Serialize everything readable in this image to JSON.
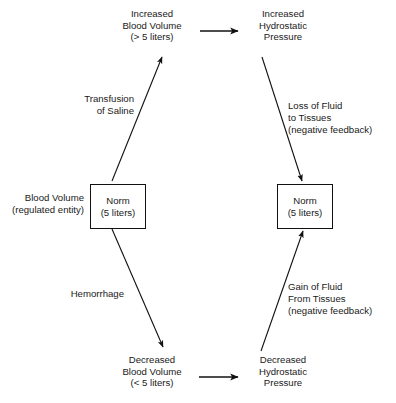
{
  "diagram": {
    "background_color": "#ffffff",
    "stroke_color": "#111111",
    "text_color": "#1a1a1a",
    "nodes": {
      "increased_volume": {
        "line1": "Increased",
        "line2": "Blood Volume",
        "line3": "(> 5 liters)"
      },
      "increased_pressure": {
        "line1": "Increased",
        "line2": "Hydrostatic",
        "line3": "Pressure"
      },
      "decreased_volume": {
        "line1": "Decreased",
        "line2": "Blood Volume",
        "line3": "(< 5 liters)"
      },
      "decreased_pressure": {
        "line1": "Decreased",
        "line2": "Hydrostatic",
        "line3": "Pressure"
      },
      "norm_left": {
        "line1": "Norm",
        "line2": "(5 liters)"
      },
      "norm_right": {
        "line1": "Norm",
        "line2": "(5 liters)"
      }
    },
    "side_label": {
      "line1": "Blood Volume",
      "line2": "(regulated entity)"
    },
    "edges": {
      "transfusion": {
        "line1": "Transfusion",
        "line2": "of Saline"
      },
      "hemorrhage": {
        "line1": "Hemorrhage"
      },
      "loss_of_fluid": {
        "line1": "Loss of Fluid",
        "line2": "to Tissues",
        "line3": "(negative feedback)"
      },
      "gain_of_fluid": {
        "line1": "Gain of Fluid",
        "line2": "From Tissues",
        "line3": "(negative feedback)"
      }
    }
  }
}
